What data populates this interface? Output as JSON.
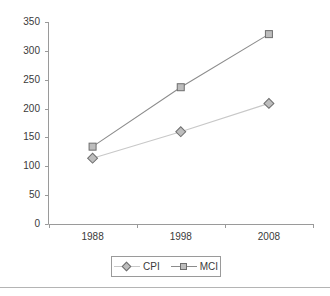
{
  "chart_data": {
    "type": "line",
    "title": "",
    "xlabel": "",
    "ylabel": "",
    "categories": [
      "1988",
      "1998",
      "2008"
    ],
    "x_values": [
      1988,
      1998,
      2008
    ],
    "ylim": [
      0,
      350
    ],
    "yticks": [
      0,
      50,
      100,
      150,
      200,
      250,
      300,
      350
    ],
    "ytick_labels": [
      "0",
      "50",
      "100",
      "150",
      "200",
      "250",
      "300",
      "350"
    ],
    "xtick_labels": [
      "1988",
      "1998",
      "2008"
    ],
    "grid": false,
    "legend_position": "bottom",
    "series": [
      {
        "name": "CPI",
        "marker": "diamond",
        "values": [
          114,
          160,
          209
        ],
        "line_color": "#c8c8c8",
        "marker_fill": "#bdbdbd",
        "marker_edge": "#6e6e6e"
      },
      {
        "name": "MCI",
        "marker": "square",
        "values": [
          134,
          237,
          329
        ],
        "line_color": "#8c8c8c",
        "marker_fill": "#bdbdbd",
        "marker_edge": "#6e6e6e"
      }
    ]
  },
  "legend": {
    "entries": [
      {
        "label": "CPI"
      },
      {
        "label": "MCI"
      }
    ]
  },
  "axes": {
    "axis_color": "#9a9a9a",
    "text_color": "#3a3a3a"
  }
}
